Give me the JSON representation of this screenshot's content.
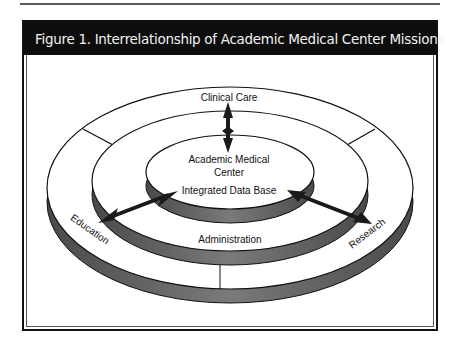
{
  "figure": {
    "title": "Figure 1. Interrelationship of Academic Medical Center Missions"
  },
  "diagram": {
    "center_label_line1": "Academic Medical",
    "center_label_line2": "Center",
    "inner_ring_label": "Integrated Data Base",
    "middle_ring_label": "Administration",
    "outer_ring_labels": {
      "top": "Clinical Care",
      "left": "Education",
      "right": "Research"
    },
    "colors": {
      "title_bar": "#0d0d0d",
      "ring_side": "#6e6e6e",
      "ring_top": "#ffffff",
      "arrow": "#1a1a1a"
    }
  }
}
